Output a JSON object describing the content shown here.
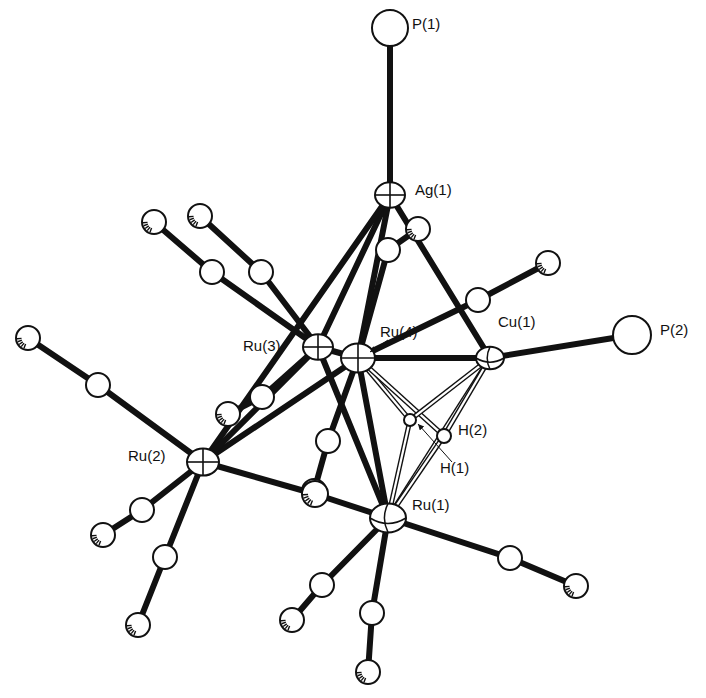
{
  "figure": {
    "type": "ORTEP molecular structure diagram",
    "background": "#ffffff",
    "ink": "#111111"
  },
  "atoms": [
    {
      "id": "P1",
      "label": "P(1)",
      "x": 390,
      "y": 28,
      "r": 18,
      "kind": "plain",
      "label_x": 412,
      "label_y": 24
    },
    {
      "id": "Ag1",
      "label": "Ag(1)",
      "x": 390,
      "y": 195,
      "r": 15,
      "kind": "cross",
      "label_x": 415,
      "label_y": 190
    },
    {
      "id": "Ru4",
      "label": "Ru(4)",
      "x": 358,
      "y": 358,
      "r": 17,
      "kind": "cross",
      "label_x": 380,
      "label_y": 332
    },
    {
      "id": "Ru3",
      "label": "Ru(3)",
      "x": 318,
      "y": 347,
      "r": 15,
      "kind": "cross",
      "label_x": 243,
      "label_y": 346
    },
    {
      "id": "Cu1",
      "label": "Cu(1)",
      "x": 490,
      "y": 358,
      "r": 14,
      "kind": "octant",
      "label_x": 498,
      "label_y": 322
    },
    {
      "id": "P2",
      "label": "P(2)",
      "x": 632,
      "y": 335,
      "r": 19,
      "kind": "plain",
      "label_x": 660,
      "label_y": 330
    },
    {
      "id": "Ru2",
      "label": "Ru(2)",
      "x": 203,
      "y": 462,
      "r": 16,
      "kind": "cross",
      "label_x": 128,
      "label_y": 456
    },
    {
      "id": "Ru1",
      "label": "Ru(1)",
      "x": 388,
      "y": 518,
      "r": 18,
      "kind": "octant",
      "label_x": 412,
      "label_y": 505
    },
    {
      "id": "H1",
      "label": "H(1)",
      "x": 410,
      "y": 420,
      "r": 6,
      "kind": "plain",
      "label_x": 440,
      "label_y": 468
    },
    {
      "id": "H2",
      "label": "H(2)",
      "x": 444,
      "y": 436,
      "r": 7,
      "kind": "plain",
      "label_x": 458,
      "label_y": 430
    }
  ],
  "carbonyls": [
    {
      "metal": "Ru3",
      "c": [
        212,
        272
      ],
      "o": [
        154,
        222
      ]
    },
    {
      "metal": "Ru3",
      "c": [
        261,
        272
      ],
      "o": [
        200,
        216
      ]
    },
    {
      "metal": "Ru3",
      "c": [
        262,
        397
      ],
      "o": [
        228,
        414
      ]
    },
    {
      "metal": "Ru4",
      "c": [
        388,
        250
      ],
      "o": [
        418,
        229
      ]
    },
    {
      "metal": "Ru4",
      "c": [
        478,
        300
      ],
      "o": [
        548,
        263
      ]
    },
    {
      "metal": "Ru4",
      "c": [
        328,
        441
      ],
      "o": [
        314,
        491
      ]
    },
    {
      "metal": "Ru2",
      "c": [
        98,
        385
      ],
      "o": [
        28,
        338
      ]
    },
    {
      "metal": "Ru2",
      "c": [
        142,
        510
      ],
      "o": [
        103,
        535
      ]
    },
    {
      "metal": "Ru2",
      "c": [
        165,
        557
      ],
      "o": [
        138,
        625
      ]
    },
    {
      "metal": "Ru1",
      "c": [
        510,
        558
      ],
      "o": [
        576,
        586
      ]
    },
    {
      "metal": "Ru1",
      "c": [
        322,
        585
      ],
      "o": [
        292,
        620
      ]
    },
    {
      "metal": "Ru1",
      "c": [
        372,
        613
      ],
      "o": [
        368,
        672
      ]
    }
  ],
  "bonds": [
    {
      "from": "P1",
      "to": "Ag1",
      "style": "solid"
    },
    {
      "from": "Ag1",
      "to": "Ru3",
      "style": "solid"
    },
    {
      "from": "Ag1",
      "to": "Ru4",
      "style": "solid"
    },
    {
      "from": "Ag1",
      "to": "Cu1",
      "style": "solid"
    },
    {
      "from": "Ag1",
      "to": "Ru2",
      "style": "solid"
    },
    {
      "from": "Cu1",
      "to": "P2",
      "style": "solid"
    },
    {
      "from": "Ru4",
      "to": "Cu1",
      "style": "solid"
    },
    {
      "from": "Ru4",
      "to": "Ru1",
      "style": "solid"
    },
    {
      "from": "Ru4",
      "to": "Ru2",
      "style": "solid"
    },
    {
      "from": "Ru3",
      "to": "Ru4",
      "style": "solid"
    },
    {
      "from": "Ru3",
      "to": "Ru1",
      "style": "solid"
    },
    {
      "from": "Ru3",
      "to": "Ru2",
      "style": "solid"
    },
    {
      "from": "Ru2",
      "to": "Ru1",
      "style": "bridging"
    },
    {
      "from": "Ru1",
      "to": "Cu1",
      "style": "hollow"
    },
    {
      "from": "Ru4",
      "to": "H1",
      "style": "hollow"
    },
    {
      "from": "Ru4",
      "to": "H2",
      "style": "hollow"
    },
    {
      "from": "H1",
      "to": "Cu1",
      "style": "hollow"
    },
    {
      "from": "H2",
      "to": "Cu1",
      "style": "hollow"
    },
    {
      "from": "H1",
      "to": "Ru1",
      "style": "hollow"
    },
    {
      "from": "H2",
      "to": "Ru1",
      "style": "hollow"
    }
  ],
  "bridging_carbonyl": {
    "c": [
      315,
      494
    ],
    "between": [
      "Ru2",
      "Ru1"
    ]
  },
  "arrows": [
    {
      "target": "Ru4",
      "from": [
        388,
        340
      ],
      "to": [
        370,
        352
      ]
    },
    {
      "target": "H1",
      "from": [
        452,
        462
      ],
      "to": [
        418,
        424
      ]
    }
  ]
}
